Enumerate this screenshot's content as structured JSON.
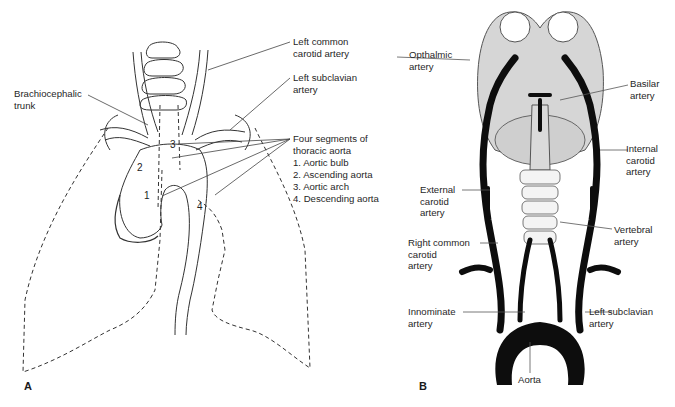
{
  "figure": {
    "panels": [
      {
        "id": "A",
        "letter": "A",
        "title": "Thoracic aorta and great vessels within lungs",
        "labels": {
          "left_common_carotid": "Left common\ncarotid artery",
          "left_subclavian": "Left subclavian\nartery",
          "brachiocephalic": "Brachiocephalic\ntrunk",
          "segments_title": "Four segments of\nthoracic aorta",
          "segments": [
            "1. Aortic bulb",
            "2. Ascending aorta",
            "3. Aortic arch",
            "4. Descending aorta"
          ]
        },
        "segment_numbers": [
          "1",
          "2",
          "3",
          "4"
        ]
      },
      {
        "id": "B",
        "letter": "B",
        "title": "Arterial supply from aorta to brain",
        "labels": {
          "opthalmic": "Opthalmic\nartery",
          "basilar": "Basilar\nartery",
          "internal_carotid": "Internal\ncarotid\nartery",
          "external_carotid": "External\ncarotid\nartery",
          "vertebral": "Vertebral\nartery",
          "right_common_carotid": "Right common\ncarotid\nartery",
          "innominate": "Innominate\nartery",
          "left_subclavian": "Left subclavian\nartery",
          "aorta": "Aorta"
        }
      }
    ],
    "colors": {
      "line": "#333333",
      "vessel_fill": "#0d0d0d",
      "brain_fill": "#d6d6d6",
      "background": "#ffffff"
    }
  }
}
